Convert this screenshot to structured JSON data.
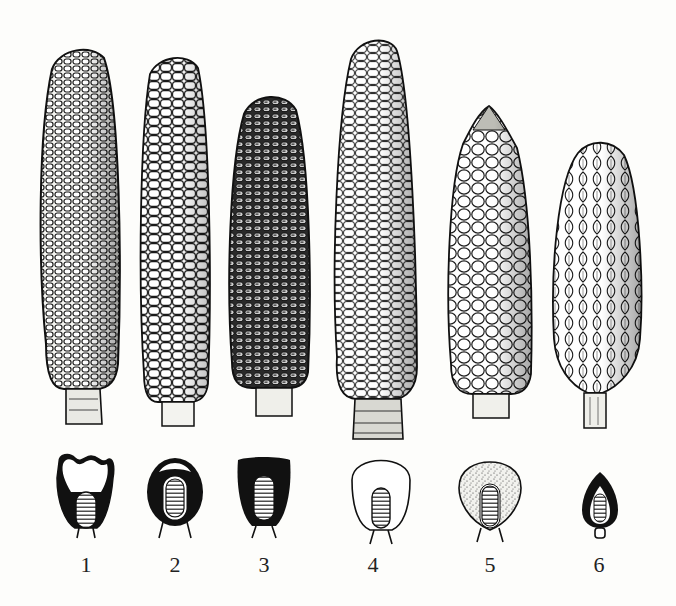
{
  "figure": {
    "background": "#fdfdfb",
    "ink": "#151515",
    "items": [
      {
        "label": "1",
        "ear": {
          "x": 38,
          "y": 45,
          "w": 84,
          "h": 380,
          "kernel_style": "dense-dark-outline"
        },
        "kernel_section": {
          "cx": 85,
          "style": "white-top-dark-sides"
        }
      },
      {
        "label": "2",
        "ear": {
          "x": 138,
          "y": 55,
          "w": 74,
          "h": 370,
          "kernel_style": "white-large"
        },
        "kernel_section": {
          "cx": 175,
          "style": "dark-round-with-light-cap"
        }
      },
      {
        "label": "3",
        "ear": {
          "x": 228,
          "y": 93,
          "w": 82,
          "h": 322,
          "kernel_style": "dark-dense"
        },
        "kernel_section": {
          "cx": 263,
          "style": "all-dark"
        }
      },
      {
        "label": "4",
        "ear": {
          "x": 333,
          "y": 38,
          "w": 85,
          "h": 402,
          "kernel_style": "white-tall"
        },
        "kernel_section": {
          "cx": 388,
          "style": "all-white"
        }
      },
      {
        "label": "5",
        "ear": {
          "x": 445,
          "y": 105,
          "w": 88,
          "h": 313,
          "kernel_style": "round-pointed"
        },
        "kernel_section": {
          "cx": 490,
          "style": "stippled"
        }
      },
      {
        "label": "6",
        "ear": {
          "x": 550,
          "y": 140,
          "w": 93,
          "h": 288,
          "kernel_style": "pod-husked"
        },
        "kernel_section": {
          "cx": 600,
          "style": "small-dark-pointed"
        }
      }
    ],
    "labels": [
      "1",
      "2",
      "3",
      "4",
      "5",
      "6"
    ]
  }
}
